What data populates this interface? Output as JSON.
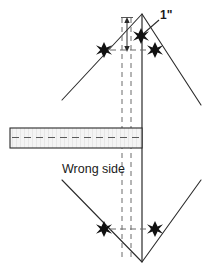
{
  "figure": {
    "background_color": "#ffffff",
    "line_color": "#2b2b2b",
    "dash_color": "#6b6b6b",
    "fill_color": "#f2f2f2",
    "width": 211,
    "height": 276
  },
  "labels": {
    "dimension": "1\"",
    "wrong_side": "Wrong side"
  },
  "markers": {
    "star_symbol": "star",
    "star_count": 4,
    "star_positions": [
      {
        "name": "top-left-star",
        "x": 104,
        "y": 50
      },
      {
        "name": "top-right-star",
        "x": 155,
        "y": 50
      },
      {
        "name": "bottom-left-star",
        "x": 104,
        "y": 229
      },
      {
        "name": "bottom-right-star",
        "x": 155,
        "y": 229
      }
    ]
  },
  "geometry": {
    "apex_top": {
      "x": 142,
      "y": 14
    },
    "apex_bottom": {
      "x": 142,
      "y": 262
    },
    "fold_line_x": 142,
    "dashed_line_left_x": 122,
    "dashed_line_right_x": 131,
    "strip": {
      "left": 10,
      "right": 142,
      "top": 128,
      "bottom": 148
    },
    "dimension_arrow": {
      "x": 127,
      "top_y": 18,
      "bottom_y": 50,
      "value": "1\""
    }
  }
}
